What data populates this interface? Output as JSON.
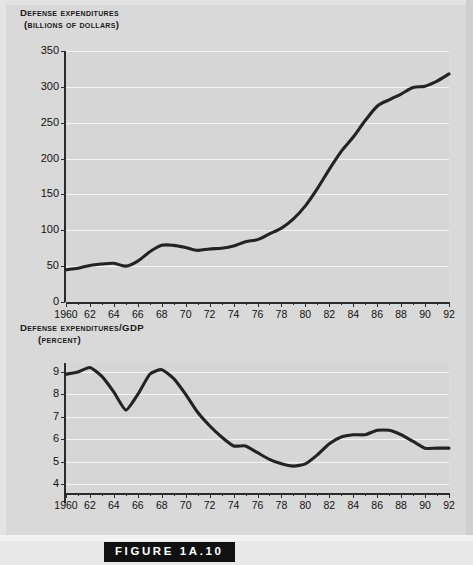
{
  "figure": {
    "caption": "FIGURE 1A.10",
    "background_color": "#d9d9d9",
    "plot_background_color": "#d6d6d6",
    "gridline_color": "#f4f4f4",
    "line_color": "#232323"
  },
  "chart_data": [
    {
      "type": "line",
      "id": "defense-expenditures",
      "title": "Defense expenditures",
      "subtitle": "(billions of dollars)",
      "xlabel": "",
      "ylabel": "Defense expenditures (billions of dollars)",
      "xlim": [
        1960,
        1992
      ],
      "ylim": [
        0,
        350
      ],
      "ytick_labels": [
        "350",
        "300",
        "250",
        "200",
        "150",
        "100",
        "50",
        "0"
      ],
      "ytick_values": [
        350,
        300,
        250,
        200,
        150,
        100,
        50,
        0
      ],
      "xtick_labels": [
        "1960",
        "62",
        "64",
        "66",
        "68",
        "70",
        "72",
        "74",
        "76",
        "78",
        "80",
        "82",
        "84",
        "86",
        "88",
        "90",
        "92"
      ],
      "xtick_values": [
        1960,
        1962,
        1964,
        1966,
        1968,
        1970,
        1972,
        1974,
        1976,
        1978,
        1980,
        1982,
        1984,
        1986,
        1988,
        1990,
        1992
      ],
      "grid": true,
      "legend": "none",
      "x": [
        1960,
        1961,
        1962,
        1963,
        1964,
        1965,
        1966,
        1967,
        1968,
        1969,
        1970,
        1971,
        1972,
        1973,
        1974,
        1975,
        1976,
        1977,
        1978,
        1979,
        1980,
        1981,
        1982,
        1983,
        1984,
        1985,
        1986,
        1987,
        1988,
        1989,
        1990,
        1991,
        1992
      ],
      "values": [
        45,
        47,
        51,
        53,
        54,
        50,
        57,
        70,
        79,
        79,
        76,
        72,
        74,
        75,
        78,
        84,
        87,
        95,
        103,
        116,
        134,
        158,
        185,
        210,
        230,
        253,
        273,
        282,
        290,
        299,
        301,
        308,
        318
      ]
    },
    {
      "type": "line",
      "id": "defense-expenditures-gdp",
      "title": "Defense expenditures/GDP",
      "subtitle": "(percent)",
      "xlabel": "",
      "ylabel": "Defense expenditures/GDP (percent)",
      "xlim": [
        1960,
        1992
      ],
      "ylim": [
        3.6,
        9.4
      ],
      "ytick_labels": [
        "9",
        "8",
        "7",
        "6",
        "5",
        "4"
      ],
      "ytick_values": [
        9,
        8,
        7,
        6,
        5,
        4
      ],
      "xtick_labels": [
        "1960",
        "62",
        "64",
        "66",
        "68",
        "70",
        "72",
        "74",
        "76",
        "78",
        "80",
        "82",
        "84",
        "86",
        "88",
        "90",
        "92"
      ],
      "xtick_values": [
        1960,
        1962,
        1964,
        1966,
        1968,
        1970,
        1972,
        1974,
        1976,
        1978,
        1980,
        1982,
        1984,
        1986,
        1988,
        1990,
        1992
      ],
      "grid": true,
      "legend": "none",
      "x": [
        1960,
        1961,
        1962,
        1963,
        1964,
        1965,
        1966,
        1967,
        1968,
        1969,
        1970,
        1971,
        1972,
        1973,
        1974,
        1975,
        1976,
        1977,
        1978,
        1979,
        1980,
        1981,
        1982,
        1983,
        1984,
        1985,
        1986,
        1987,
        1988,
        1989,
        1990,
        1991,
        1992
      ],
      "values": [
        8.9,
        9.0,
        9.2,
        8.8,
        8.1,
        7.3,
        8.0,
        8.9,
        9.1,
        8.7,
        8.0,
        7.2,
        6.6,
        6.1,
        5.7,
        5.7,
        5.4,
        5.1,
        4.9,
        4.8,
        4.9,
        5.3,
        5.8,
        6.1,
        6.2,
        6.2,
        6.4,
        6.4,
        6.2,
        5.9,
        5.6,
        5.6,
        5.6
      ]
    }
  ]
}
